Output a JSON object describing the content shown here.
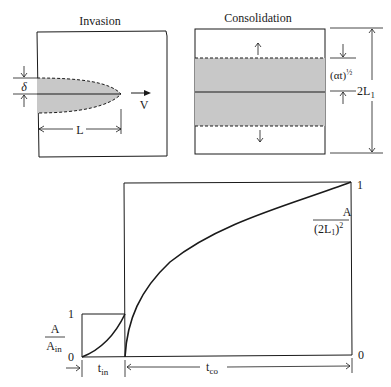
{
  "invasion": {
    "title": "Invasion",
    "delta_label": "δ",
    "velocity_label": "V",
    "length_label": "L"
  },
  "consolidation": {
    "title": "Consolidation",
    "diffusion_label": "(αt)",
    "diffusion_exp": "½",
    "height_label": "2L",
    "height_sub": "1"
  },
  "graph": {
    "left_axis": {
      "num": "A",
      "den": "A",
      "den_sub": "in",
      "tick_top": "1",
      "tick_bottom": "0"
    },
    "right_axis": {
      "num": "A",
      "den_prefix": "(2L",
      "den_sub": "1",
      "den_suffix": ")",
      "den_exp": "2",
      "tick_top": "1",
      "tick_bottom": "0"
    },
    "t_in": {
      "t": "t",
      "sub": "in"
    },
    "t_co": {
      "t": "t",
      "sub": "co"
    }
  },
  "colors": {
    "line": "#1a1a1a",
    "fill": "#c8c8c8"
  }
}
